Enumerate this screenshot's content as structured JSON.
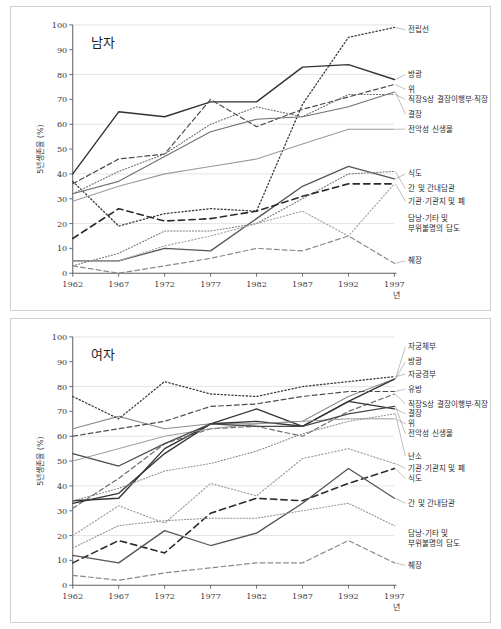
{
  "figure": {
    "background_color": "#ffffff",
    "border_color": "#cfcfcf",
    "caption": ""
  },
  "axes": {
    "x_title": "년",
    "y_title": "5년생존율 (%)",
    "x_ticks": [
      "1962",
      "1967",
      "1972",
      "1977",
      "1982",
      "1987",
      "1992",
      "1997"
    ],
    "y_ticks": [
      "0",
      "10",
      "20",
      "30",
      "40",
      "50",
      "60",
      "70",
      "80",
      "90",
      "100"
    ]
  },
  "panels": [
    {
      "id": "male",
      "title": "남자"
    },
    {
      "id": "female",
      "title": "여자"
    }
  ],
  "chart_data": [
    {
      "type": "line",
      "title": "남자",
      "xlabel": "년",
      "ylabel": "5년생존율 (%)",
      "xlim": [
        1962,
        1997
      ],
      "ylim": [
        0,
        100
      ],
      "grid": true,
      "legend": "right-outside-labels",
      "x": [
        1962,
        1967,
        1972,
        1977,
        1982,
        1987,
        1992,
        1997
      ],
      "series": [
        {
          "name": "전립선",
          "values": [
            37,
            19,
            24,
            26,
            25,
            68,
            95,
            99
          ],
          "style": "dotted",
          "color": "#3a3a3a",
          "width": 1.3
        },
        {
          "name": "방광",
          "values": [
            40,
            65,
            63,
            69,
            69,
            83,
            84,
            78
          ],
          "style": "solid",
          "color": "#333333",
          "width": 1.4
        },
        {
          "name": "위",
          "values": [
            36,
            46,
            48,
            70,
            59,
            66,
            71,
            76
          ],
          "style": "dashed",
          "color": "#4d4d4d",
          "width": 1.2
        },
        {
          "name": "직장S상 결장이행부·직장",
          "values": [
            32,
            41,
            48,
            60,
            67,
            63,
            72,
            72
          ],
          "style": "dotted",
          "color": "#6e6e6e",
          "width": 1.1
        },
        {
          "name": "결장",
          "values": [
            32,
            37,
            47,
            57,
            62,
            63,
            67,
            73
          ],
          "style": "solid",
          "color": "#717171",
          "width": 1.1
        },
        {
          "name": "전악성 신생물",
          "values": [
            29,
            35,
            40,
            43,
            46,
            52,
            58,
            58
          ],
          "style": "solid",
          "color": "#9b9b9b",
          "width": 1.1
        },
        {
          "name": "식도",
          "values": [
            5,
            5,
            10,
            9,
            22,
            35,
            43,
            38
          ],
          "style": "solid",
          "color": "#555555",
          "width": 1.3
        },
        {
          "name": "간 및 간내담관",
          "values": [
            3,
            8,
            17,
            17,
            20,
            30,
            40,
            41
          ],
          "style": "dotted",
          "color": "#777777",
          "width": 1.1
        },
        {
          "name": "기관·기관지 및 폐",
          "values": [
            14,
            26,
            21,
            22,
            25,
            31,
            36,
            36
          ],
          "style": "dashed",
          "color": "#2b2b2b",
          "width": 1.6
        },
        {
          "name": "담낭·기타 및 부위불명의 담도",
          "values": [
            5,
            5,
            11,
            15,
            20,
            25,
            15,
            36
          ],
          "style": "dotted",
          "color": "#a5a5a5",
          "width": 1.2
        },
        {
          "name": "췌장",
          "values": [
            3,
            0,
            3,
            6,
            10,
            9,
            15,
            4
          ],
          "style": "dashed",
          "color": "#8a8a8a",
          "width": 1.2
        }
      ],
      "labels": [
        {
          "name": "전립선",
          "y": 98
        },
        {
          "name": "방광",
          "y": 80
        },
        {
          "name": "위",
          "y": 74
        },
        {
          "name": "직장S상 결장이행부·직장",
          "y": 70
        },
        {
          "name": "결장",
          "y": 64
        },
        {
          "name": "전악성 신생물",
          "y": 58
        },
        {
          "name": "식도",
          "y": 40
        },
        {
          "name": "간 및 간내담관",
          "y": 34
        },
        {
          "name": "기관·기관지 및 폐",
          "y": 29
        },
        {
          "name": "담낭·기타 및",
          "y": 22
        },
        {
          "name": "부위불명의 담도",
          "y": 18
        },
        {
          "name": "췌장",
          "y": 5
        }
      ]
    },
    {
      "type": "line",
      "title": "여자",
      "xlabel": "년",
      "ylabel": "5년생존율 (%)",
      "xlim": [
        1962,
        1997
      ],
      "ylim": [
        0,
        100
      ],
      "grid": true,
      "legend": "right-outside-labels",
      "x": [
        1962,
        1967,
        1972,
        1977,
        1982,
        1987,
        1992,
        1997
      ],
      "series": [
        {
          "name": "자궁체부",
          "values": [
            63,
            68,
            63,
            65,
            65,
            66,
            76,
            83
          ],
          "style": "solid",
          "color": "#8d8d8d",
          "width": 1.1
        },
        {
          "name": "방광",
          "values": [
            34,
            35,
            55,
            65,
            66,
            64,
            74,
            83
          ],
          "style": "solid",
          "color": "#333333",
          "width": 1.4
        },
        {
          "name": "자궁경부",
          "values": [
            76,
            67,
            82,
            77,
            76,
            80,
            82,
            84
          ],
          "style": "dotted",
          "color": "#3a3a3a",
          "width": 1.3
        },
        {
          "name": "유방",
          "values": [
            60,
            63,
            66,
            72,
            73,
            76,
            78,
            78
          ],
          "style": "dashed",
          "color": "#4d4d4d",
          "width": 1.2
        },
        {
          "name": "직장S상 결장이행부·직장",
          "values": [
            31,
            43,
            57,
            63,
            64,
            60,
            70,
            77
          ],
          "style": "dashed",
          "color": "#6d6d6d",
          "width": 1.2
        },
        {
          "name": "결장",
          "values": [
            33,
            37,
            53,
            65,
            71,
            64,
            74,
            71
          ],
          "style": "solid",
          "color": "#333333",
          "width": 1.3
        },
        {
          "name": "위",
          "values": [
            50,
            55,
            60,
            63,
            65,
            66,
            67,
            67
          ],
          "style": "solid",
          "color": "#9a9a9a",
          "width": 1.0
        },
        {
          "name": "전악성 신생물",
          "values": [
            53,
            48,
            57,
            65,
            64,
            64,
            69,
            72
          ],
          "style": "solid",
          "color": "#4a4a4a",
          "width": 1.3
        },
        {
          "name": "난소",
          "values": [
            34,
            39,
            46,
            49,
            54,
            61,
            66,
            69
          ],
          "style": "dotted",
          "color": "#8a8a8a",
          "width": 1.1
        },
        {
          "name": "기관·기관지 및 폐",
          "values": [
            20,
            32,
            25,
            41,
            36,
            51,
            55,
            49
          ],
          "style": "dotted",
          "color": "#9e9e9e",
          "width": 1.2
        },
        {
          "name": "식도",
          "values": [
            9,
            18,
            13,
            29,
            35,
            34,
            41,
            47
          ],
          "style": "dashed",
          "color": "#2b2b2b",
          "width": 1.6
        },
        {
          "name": "간 및 간내담관",
          "values": [
            12,
            9,
            22,
            16,
            21,
            33,
            47,
            35
          ],
          "style": "solid",
          "color": "#555555",
          "width": 1.3
        },
        {
          "name": "담낭·기타 및 부위불명의 담도",
          "values": [
            15,
            24,
            26,
            27,
            27,
            30,
            33,
            24
          ],
          "style": "dotted",
          "color": "#8f8f8f",
          "width": 1.1
        },
        {
          "name": "췌장",
          "values": [
            4,
            2,
            5,
            7,
            9,
            9,
            18,
            9
          ],
          "style": "dashed",
          "color": "#8a8a8a",
          "width": 1.2
        }
      ],
      "labels": [
        {
          "name": "자궁체부",
          "y": 96
        },
        {
          "name": "방광",
          "y": 90
        },
        {
          "name": "자궁경부",
          "y": 85
        },
        {
          "name": "유방",
          "y": 79
        },
        {
          "name": "직장S상 결장이행부·직장",
          "y": 73
        },
        {
          "name": "결장",
          "y": 69
        },
        {
          "name": "위",
          "y": 65
        },
        {
          "name": "전악성 신생물",
          "y": 61
        },
        {
          "name": "난소",
          "y": 52
        },
        {
          "name": "기관·기관지 및 폐",
          "y": 47
        },
        {
          "name": "식도",
          "y": 43
        },
        {
          "name": "간 및 간내담관",
          "y": 33
        },
        {
          "name": "담낭·기타 및",
          "y": 21
        },
        {
          "name": "부위불명의 담도",
          "y": 17
        },
        {
          "name": "췌장",
          "y": 8
        }
      ]
    }
  ]
}
